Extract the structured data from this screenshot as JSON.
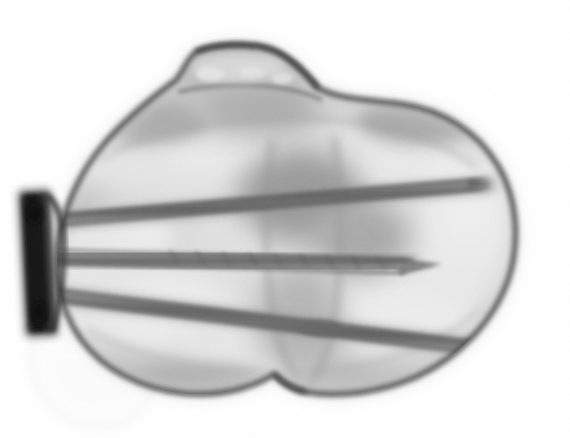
{
  "image": {
    "kind": "radiograph",
    "modality_label": "X-ray",
    "view_label": "Axial / skyline view of distal femur",
    "width": 570,
    "height": 438,
    "background_color": "#ffffff",
    "has_text_overlay": false,
    "annotations": []
  },
  "palette": {
    "background": "#ffffff",
    "bone_bright": "#fafafa",
    "bone_mid": "#c8c8c8",
    "bone_shadow": "#9a9a9a",
    "cortex_dark": "#5a5a5a",
    "cortex_edge": "#3c3c3c",
    "hardware_screw": "#6e6e6e",
    "hardware_plate": "#1c1c1c",
    "soft_tissue": "#f0f0f0"
  },
  "anatomy": {
    "outline": {
      "label": "distal femur condylar mass",
      "bounds": {
        "x": 55,
        "y": 45,
        "w": 465,
        "h": 352
      },
      "path": "M 196 52 C 214 44 250 42 272 50 C 292 58 306 74 318 88 C 340 100 372 100 402 104 C 444 110 478 132 498 166 C 518 200 520 244 508 280 C 494 320 460 356 418 376 C 382 392 340 398 306 392 C 292 389 282 382 274 374 C 256 386 228 394 200 394 C 158 394 116 378 90 350 C 64 322 54 284 58 248 C 62 210 80 172 104 144 C 126 118 154 96 176 80 C 184 70 188 58 196 52 Z"
    },
    "patella_ridge": {
      "label": "superior trochlear protrusion",
      "bounds": {
        "x": 178,
        "y": 44,
        "w": 128,
        "h": 52
      }
    },
    "medial_condyle": {
      "label": "medial condyle",
      "bounds": {
        "x": 72,
        "y": 140,
        "w": 210,
        "h": 250
      }
    },
    "lateral_condyle": {
      "label": "lateral condyle",
      "bounds": {
        "x": 300,
        "y": 120,
        "w": 210,
        "h": 270
      }
    },
    "intercondylar_notch": {
      "label": "intercondylar notch",
      "bounds": {
        "x": 252,
        "y": 150,
        "w": 96,
        "h": 230
      },
      "apex": {
        "x": 300,
        "y": 380
      }
    },
    "soft_tissue_shadow": {
      "label": "faint soft-tissue shadow inferolateral",
      "bounds": {
        "x": 24,
        "y": 332,
        "w": 120,
        "h": 96
      }
    }
  },
  "hardware": {
    "plate": {
      "label": "fixation plate",
      "color": "#1c1c1c",
      "x": 24,
      "y": 192,
      "w": 28,
      "h": 142,
      "rotation_deg": -3
    },
    "screws": [
      {
        "label": "superior screw",
        "x1": 50,
        "y1": 220,
        "x2": 484,
        "y2": 184,
        "thickness": 13,
        "tip": "blunt",
        "color": "#6b6b6b"
      },
      {
        "label": "middle screw",
        "x1": 52,
        "y1": 256,
        "x2": 438,
        "y2": 268,
        "thickness": 16,
        "tip": "pointed",
        "color": "#6b6b6b"
      },
      {
        "label": "inferior screw",
        "x1": 52,
        "y1": 296,
        "x2": 494,
        "y2": 350,
        "thickness": 14,
        "tip": "blunt",
        "color": "#6b6b6b"
      }
    ]
  },
  "texture": {
    "trabecular_blobs": [
      {
        "cx": 150,
        "cy": 165,
        "rx": 78,
        "ry": 36,
        "tone": "#f2f2f2",
        "blur": 22
      },
      {
        "cx": 230,
        "cy": 140,
        "rx": 70,
        "ry": 40,
        "tone": "#f8f8f8",
        "blur": 24
      },
      {
        "cx": 330,
        "cy": 148,
        "rx": 68,
        "ry": 34,
        "tone": "#ededed",
        "blur": 22
      },
      {
        "cx": 408,
        "cy": 170,
        "rx": 72,
        "ry": 42,
        "tone": "#f6f6f6",
        "blur": 24
      },
      {
        "cx": 150,
        "cy": 310,
        "rx": 88,
        "ry": 48,
        "tone": "#fafafa",
        "blur": 26
      },
      {
        "cx": 250,
        "cy": 345,
        "rx": 72,
        "ry": 40,
        "tone": "#f4f4f4",
        "blur": 22
      },
      {
        "cx": 400,
        "cy": 312,
        "rx": 86,
        "ry": 50,
        "tone": "#fbfbfb",
        "blur": 28
      },
      {
        "cx": 460,
        "cy": 250,
        "rx": 54,
        "ry": 62,
        "tone": "#f7f7f7",
        "blur": 26
      },
      {
        "cx": 120,
        "cy": 235,
        "rx": 54,
        "ry": 28,
        "tone": "#f9f9f9",
        "blur": 20
      },
      {
        "cx": 300,
        "cy": 230,
        "rx": 44,
        "ry": 30,
        "tone": "#efefef",
        "blur": 20
      }
    ],
    "dark_blobs": [
      {
        "cx": 300,
        "cy": 195,
        "rx": 62,
        "ry": 46,
        "tone": "#8e8e8e",
        "blur": 26
      },
      {
        "cx": 255,
        "cy": 110,
        "rx": 62,
        "ry": 26,
        "tone": "#a6a6a6",
        "blur": 22
      },
      {
        "cx": 360,
        "cy": 240,
        "rx": 48,
        "ry": 40,
        "tone": "#a0a0a0",
        "blur": 24
      },
      {
        "cx": 200,
        "cy": 385,
        "rx": 70,
        "ry": 20,
        "tone": "#b0b0b0",
        "blur": 18
      },
      {
        "cx": 150,
        "cy": 120,
        "rx": 56,
        "ry": 22,
        "tone": "#a8a8a8",
        "blur": 20
      }
    ]
  }
}
